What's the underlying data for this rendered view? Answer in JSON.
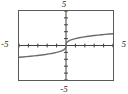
{
  "window": {
    "title": "graphing-window",
    "background": "#ffffff",
    "frame_color": "#5a5a5a",
    "curve_color": "#6b6b6b",
    "axis_color": "#3a3a3a",
    "label_color": "#2b2b2b"
  },
  "labels": {
    "top": "5",
    "bottom": "-5",
    "left": "-5",
    "right": "5"
  },
  "chart_data": {
    "type": "line",
    "title": "",
    "subtitle": "",
    "xlabel": "",
    "ylabel": "",
    "xlim": [
      -5,
      5
    ],
    "ylim": [
      -5,
      5
    ],
    "grid": false,
    "legend": null,
    "axes": {
      "x_axis_at_y": 0,
      "y_axis_at_x": 0,
      "x_tick_step": 1,
      "y_tick_step": 1,
      "x_ticks": [
        -5,
        -4,
        -3,
        -2,
        -1,
        0,
        1,
        2,
        3,
        4,
        5
      ],
      "y_ticks": [
        -5,
        -4,
        -3,
        -2,
        -1,
        0,
        1,
        2,
        3,
        4,
        5
      ],
      "tick_labels_shown": false
    },
    "series": [
      {
        "name": "y = cube root of x",
        "color": "#6b6b6b",
        "x": [
          -5.0,
          -4.6,
          -4.2,
          -3.8,
          -3.4,
          -3.0,
          -2.6,
          -2.2,
          -1.8,
          -1.4,
          -1.0,
          -0.7,
          -0.45,
          -0.25,
          -0.12,
          -0.04,
          0.0,
          0.04,
          0.12,
          0.25,
          0.45,
          0.7,
          1.0,
          1.4,
          1.8,
          2.2,
          2.6,
          3.0,
          3.4,
          3.8,
          4.2,
          4.6,
          5.0
        ],
        "y": [
          -1.71,
          -1.66,
          -1.61,
          -1.56,
          -1.504,
          -1.442,
          -1.375,
          -1.301,
          -1.216,
          -1.119,
          -1.0,
          -0.888,
          -0.766,
          -0.63,
          -0.493,
          -0.342,
          0.0,
          0.342,
          0.493,
          0.63,
          0.766,
          0.888,
          1.0,
          1.119,
          1.216,
          1.301,
          1.375,
          1.442,
          1.504,
          1.56,
          1.61,
          1.66,
          1.71
        ]
      }
    ]
  }
}
